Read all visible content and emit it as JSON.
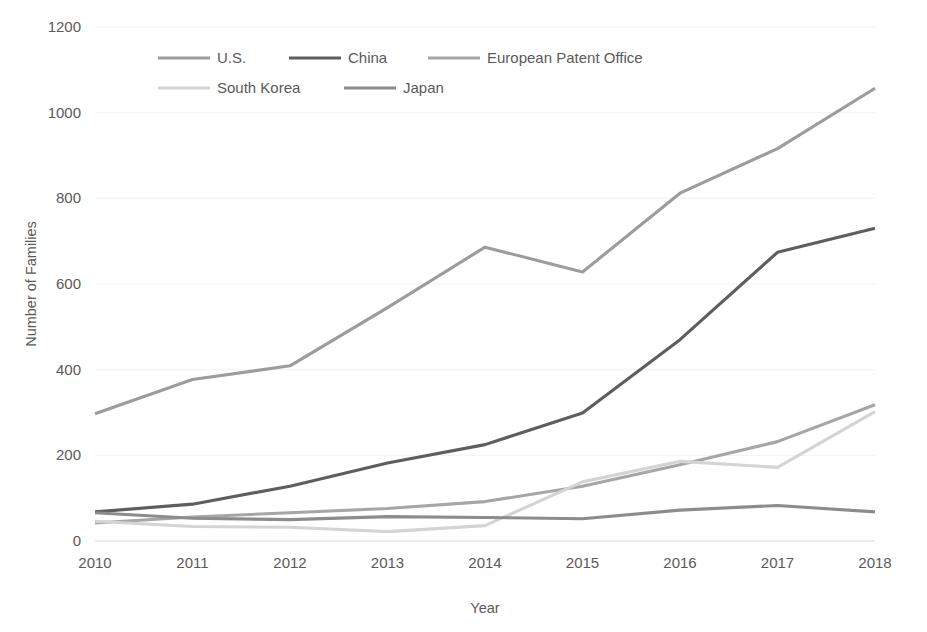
{
  "chart_data": {
    "type": "line",
    "title": "",
    "xlabel": "Year",
    "ylabel": "Number of Families",
    "categories": [
      "2010",
      "2011",
      "2012",
      "2013",
      "2014",
      "2015",
      "2016",
      "2017",
      "2018"
    ],
    "x": [
      2010,
      2011,
      2012,
      2013,
      2014,
      2015,
      2016,
      2017,
      2018
    ],
    "xlim": [
      2010,
      2018
    ],
    "ylim": [
      0,
      1200
    ],
    "yticks": [
      "0",
      "200",
      "400",
      "600",
      "800",
      "1000",
      "1200"
    ],
    "ytick_values": [
      0,
      200,
      400,
      600,
      800,
      1000,
      1200
    ],
    "grid": false,
    "legend_position": "top",
    "series": [
      {
        "name": "U.S.",
        "color": "#9c9c9c",
        "values": [
          297,
          377,
          409,
          545,
          686,
          628,
          812,
          916,
          1057
        ]
      },
      {
        "name": "China",
        "color": "#5e5e5e",
        "values": [
          68,
          86,
          128,
          182,
          225,
          299,
          470,
          674,
          730
        ]
      },
      {
        "name": "European Patent Office",
        "color": "#a6a6a6",
        "values": [
          42,
          56,
          66,
          76,
          92,
          128,
          178,
          232,
          318
        ]
      },
      {
        "name": "South Korea",
        "color": "#d4d4d4",
        "values": [
          46,
          34,
          32,
          22,
          36,
          138,
          186,
          172,
          302
        ]
      },
      {
        "name": "Japan",
        "color": "#8c8c8c",
        "values": [
          66,
          53,
          50,
          57,
          55,
          52,
          72,
          83,
          68
        ]
      }
    ]
  },
  "legend": {
    "items": [
      {
        "label": "U.S.",
        "color": "#9c9c9c"
      },
      {
        "label": "China",
        "color": "#5e5e5e"
      },
      {
        "label": "European Patent Office",
        "color": "#a6a6a6"
      },
      {
        "label": "South Korea",
        "color": "#d4d4d4"
      },
      {
        "label": "Japan",
        "color": "#8c8c8c"
      }
    ]
  },
  "axes": {
    "y_title": "Number of Families",
    "x_title": "Year"
  },
  "colors": {
    "background": "#ffffff",
    "text": "#5a5a5a",
    "axis": "#d9d9d9"
  }
}
